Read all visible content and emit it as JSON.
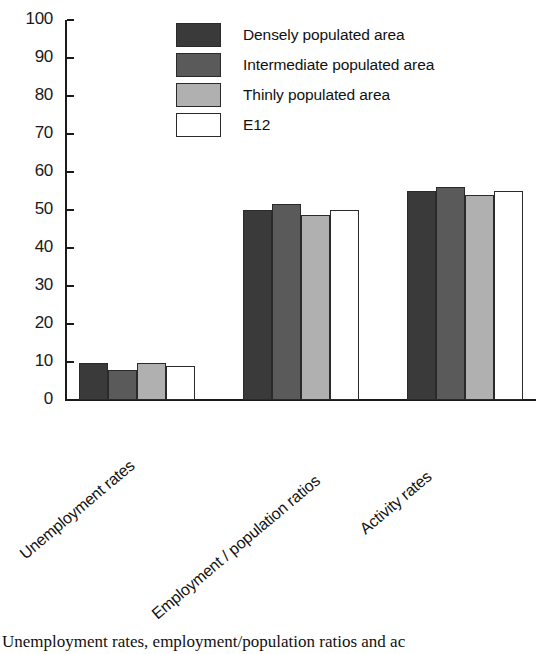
{
  "chart_data": {
    "type": "bar",
    "title": "",
    "xlabel": "",
    "ylabel": "",
    "ylim": [
      0,
      100
    ],
    "ytick_step": 10,
    "yticks": [
      100,
      90,
      80,
      70,
      60,
      50,
      40,
      30,
      20,
      10,
      0
    ],
    "grid": false,
    "legend_position": "top-center",
    "categories": [
      "Unemployment rates",
      "Employment / population ratios",
      "Activity rates"
    ],
    "series": [
      {
        "name": "Densely populated area",
        "color": "#3a3a3a",
        "values": [
          9.8,
          50.0,
          55.0
        ]
      },
      {
        "name": "Intermediate populated area",
        "color": "#5a5a5a",
        "values": [
          7.9,
          51.5,
          56.0
        ]
      },
      {
        "name": "Thinly populated area",
        "color": "#b0b0b0",
        "values": [
          9.7,
          48.8,
          54.0
        ]
      },
      {
        "name": "E12",
        "color": "#ffffff",
        "values": [
          9.0,
          50.0,
          55.0
        ]
      }
    ]
  },
  "legend": {
    "items": [
      {
        "label": "Densely populated area",
        "color": "#3a3a3a"
      },
      {
        "label": "Intermediate populated area",
        "color": "#5a5a5a"
      },
      {
        "label": "Thinly populated area",
        "color": "#b0b0b0"
      },
      {
        "label": "E12",
        "color": "#ffffff"
      }
    ]
  },
  "caption": {
    "text": "Unemployment rates, employment/population ratios and ac"
  }
}
